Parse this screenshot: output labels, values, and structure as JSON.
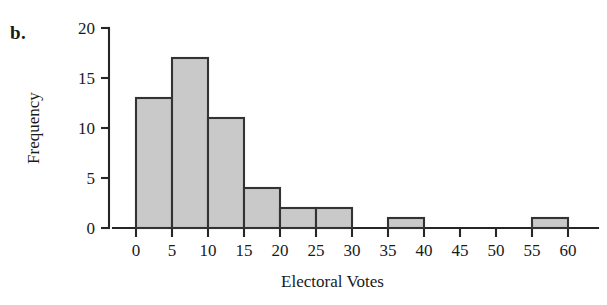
{
  "panel": {
    "letter": "b."
  },
  "chart_data": {
    "type": "bar",
    "title": "",
    "subtitle": "",
    "xlabel": "Electoral Votes",
    "ylabel": "Frequency",
    "bin_width": 5,
    "bin_edges": [
      0,
      5,
      10,
      15,
      20,
      25,
      30,
      35,
      40,
      45,
      50,
      55,
      60
    ],
    "categories": [
      "0-5",
      "5-10",
      "10-15",
      "15-20",
      "20-25",
      "25-30",
      "30-35",
      "35-40",
      "40-45",
      "45-50",
      "50-55",
      "55-60"
    ],
    "values": [
      13,
      17,
      11,
      4,
      2,
      2,
      0,
      1,
      0,
      0,
      0,
      1
    ],
    "xlim": [
      0,
      60
    ],
    "ylim": [
      0,
      20
    ],
    "xticks": [
      0,
      5,
      10,
      15,
      20,
      25,
      30,
      35,
      40,
      45,
      50,
      55,
      60
    ],
    "xtick_labels": [
      "0",
      "5",
      "10",
      "15",
      "20",
      "25",
      "30",
      "35",
      "40",
      "45",
      "50",
      "55",
      "60"
    ],
    "yticks": [
      0,
      5,
      10,
      15,
      20
    ],
    "ytick_labels": [
      "0",
      "5",
      "10",
      "15",
      "20"
    ],
    "grid": false,
    "legend": false,
    "legend_position": "none",
    "colors": {
      "bar_fill": "#c9c9c9",
      "bar_edge": "#333333",
      "axis": "#262626",
      "text": "#1a1a1a",
      "background": "#ffffff"
    }
  }
}
